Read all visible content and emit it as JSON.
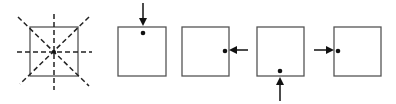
{
  "diagram": {
    "colors": {
      "stroke": "#555555",
      "dash": "#222222",
      "arrow": "#111111",
      "dot": "#111111",
      "background": "#ffffff"
    },
    "panels": [
      {
        "id": "symmetry",
        "type": "square-with-axes",
        "axes": [
          "vertical",
          "horizontal",
          "diagonal-1",
          "diagonal-2"
        ],
        "center_dot": true
      },
      {
        "id": "from-top",
        "type": "square-with-arrow",
        "arrow_direction": "down",
        "dot_position": "top-edge"
      },
      {
        "id": "from-right",
        "type": "square-with-arrow",
        "arrow_direction": "left",
        "dot_position": "right-edge"
      },
      {
        "id": "from-bottom",
        "type": "square-with-arrow",
        "arrow_direction": "up",
        "dot_position": "bottom-edge"
      },
      {
        "id": "from-left",
        "type": "square-with-arrow",
        "arrow_direction": "right",
        "dot_position": "left-edge"
      }
    ]
  }
}
